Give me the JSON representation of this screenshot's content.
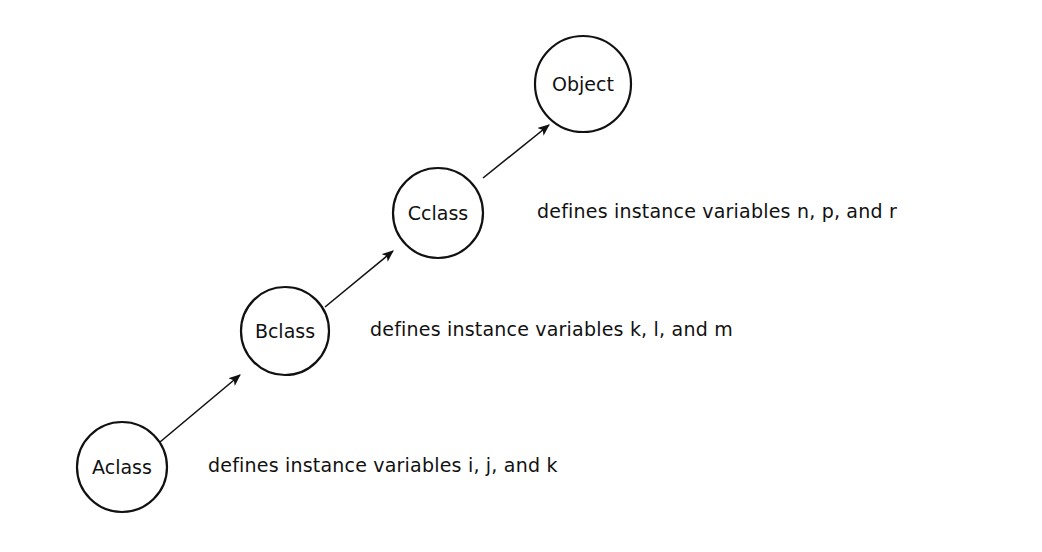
{
  "diagram": {
    "type": "class-inheritance-chain",
    "nodes": [
      {
        "id": "aclass",
        "label": "Aclass",
        "cx": 122,
        "cy": 467,
        "r": 45
      },
      {
        "id": "bclass",
        "label": "Bclass",
        "cx": 285,
        "cy": 331,
        "r": 44
      },
      {
        "id": "cclass",
        "label": "Cclass",
        "cx": 438,
        "cy": 213,
        "r": 45
      },
      {
        "id": "object",
        "label": "Object",
        "cx": 583,
        "cy": 84,
        "r": 48
      }
    ],
    "edges": [
      {
        "from": "aclass",
        "to": "bclass"
      },
      {
        "from": "bclass",
        "to": "cclass"
      },
      {
        "from": "cclass",
        "to": "object"
      }
    ],
    "notes": [
      {
        "target": "aclass",
        "text": "defines instance variables i, j, and k"
      },
      {
        "target": "bclass",
        "text": "defines instance variables k, l, and m"
      },
      {
        "target": "cclass",
        "text": "defines instance variables n, p, and r"
      }
    ]
  },
  "colors": {
    "stroke": "#111111",
    "background": "#ffffff"
  }
}
